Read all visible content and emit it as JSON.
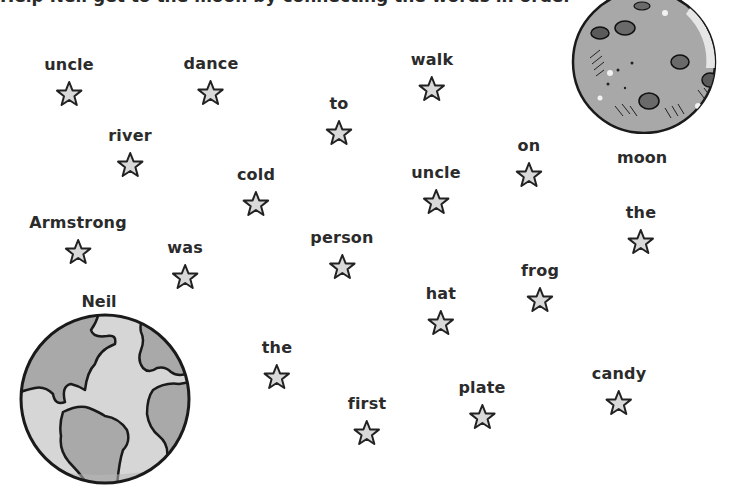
{
  "header": {
    "instruction_partial": "Help Neil get to the moon by connecting the words in order"
  },
  "colors": {
    "star_fill": "#d9d9d9",
    "star_stroke": "#222222",
    "text": "#2b2b2b",
    "earth_land": "#a9a9a9",
    "earth_ocean": "#d6d6d6",
    "moon_fill": "#a8a8a8"
  },
  "planets": {
    "earth": {
      "label": "Neil",
      "icon": "earth-icon"
    },
    "moon": {
      "label": "moon",
      "icon": "moon-icon"
    }
  },
  "stars": [
    {
      "word": "uncle",
      "x": 69,
      "y": 58
    },
    {
      "word": "dance",
      "x": 211,
      "y": 57
    },
    {
      "word": "walk",
      "x": 432,
      "y": 53
    },
    {
      "word": "to",
      "x": 339,
      "y": 97
    },
    {
      "word": "river",
      "x": 130,
      "y": 129
    },
    {
      "word": "on",
      "x": 529,
      "y": 139
    },
    {
      "word": "cold",
      "x": 256,
      "y": 168
    },
    {
      "word": "uncle",
      "x": 436,
      "y": 166
    },
    {
      "word": "the",
      "x": 641,
      "y": 206
    },
    {
      "word": "Armstrong",
      "x": 78,
      "y": 216
    },
    {
      "word": "person",
      "x": 342,
      "y": 231
    },
    {
      "word": "was",
      "x": 185,
      "y": 241
    },
    {
      "word": "frog",
      "x": 540,
      "y": 264
    },
    {
      "word": "hat",
      "x": 441,
      "y": 287
    },
    {
      "word": "the",
      "x": 277,
      "y": 341
    },
    {
      "word": "candy",
      "x": 619,
      "y": 367
    },
    {
      "word": "plate",
      "x": 482,
      "y": 381
    },
    {
      "word": "first",
      "x": 367,
      "y": 397
    }
  ]
}
